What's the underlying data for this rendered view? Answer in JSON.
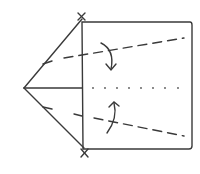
{
  "diagram": {
    "ink_color": "#3a3a3a",
    "background": "#ffffff",
    "elements": [
      {
        "name": "square-paper",
        "kind": "rectangle"
      },
      {
        "name": "left-triangle-flap",
        "kind": "triangle"
      },
      {
        "name": "upper-valley-fold",
        "kind": "dashed-line"
      },
      {
        "name": "lower-valley-fold",
        "kind": "dashed-line"
      },
      {
        "name": "center-crease",
        "kind": "dotted-line"
      },
      {
        "name": "upper-fold-arrow",
        "kind": "curved-arrow",
        "direction": "down"
      },
      {
        "name": "lower-fold-arrow",
        "kind": "curved-arrow",
        "direction": "up"
      },
      {
        "name": "top-reference-mark",
        "kind": "x-mark"
      },
      {
        "name": "bottom-reference-mark",
        "kind": "x-mark"
      }
    ]
  }
}
